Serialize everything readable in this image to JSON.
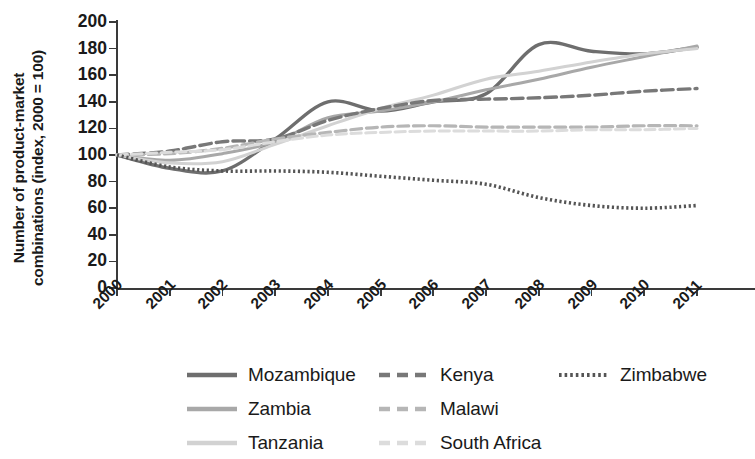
{
  "chart_data": {
    "type": "line",
    "title": "",
    "xlabel": "",
    "ylabel": "Number of product-market combinations (index, 2000 = 100)",
    "ylabel_line1": "Number of product-market",
    "ylabel_line2": "combinations (index, 2000 = 100)",
    "categories": [
      "2000",
      "2001",
      "2002",
      "2003",
      "2004",
      "2005",
      "2006",
      "2007",
      "2008",
      "2009",
      "2010",
      "2011"
    ],
    "x": [
      2000,
      2001,
      2002,
      2003,
      2004,
      2005,
      2006,
      2007,
      2008,
      2009,
      2010,
      2011
    ],
    "ylim": [
      0,
      200
    ],
    "xlim": [
      2000,
      2011
    ],
    "yticks": [
      0,
      20,
      40,
      60,
      80,
      100,
      120,
      140,
      160,
      180,
      200
    ],
    "grid": false,
    "legend_position": "bottom",
    "series": [
      {
        "name": "Mozambique",
        "style": "solid",
        "color": "#6e6e6e",
        "width": 3.4,
        "values": [
          100,
          90,
          88,
          112,
          140,
          133,
          140,
          146,
          183,
          178,
          176,
          181
        ]
      },
      {
        "name": "Zambia",
        "style": "solid",
        "color": "#a8a8a8",
        "width": 3.0,
        "values": [
          100,
          96,
          101,
          110,
          128,
          133,
          140,
          149,
          157,
          166,
          174,
          182
        ]
      },
      {
        "name": "Tanzania",
        "style": "solid",
        "color": "#d2d2d2",
        "width": 3.0,
        "values": [
          100,
          94,
          95,
          108,
          122,
          135,
          145,
          157,
          163,
          170,
          176,
          180
        ]
      },
      {
        "name": "Kenya",
        "style": "dashed",
        "color": "#787878",
        "width": 3.4,
        "values": [
          100,
          103,
          110,
          112,
          126,
          135,
          141,
          142,
          143,
          145,
          148,
          150
        ]
      },
      {
        "name": "Malawi",
        "style": "dashed",
        "color": "#b6b6b6",
        "width": 3.2,
        "values": [
          100,
          101,
          105,
          112,
          117,
          121,
          122,
          121,
          121,
          121,
          122,
          122
        ]
      },
      {
        "name": "South Africa",
        "style": "dashed",
        "color": "#dcdcdc",
        "width": 3.0,
        "values": [
          100,
          102,
          104,
          110,
          115,
          117,
          118,
          118,
          118,
          119,
          119,
          120
        ]
      },
      {
        "name": "Zimbabwe",
        "style": "dotted",
        "color": "#555555",
        "width": 3.6,
        "values": [
          100,
          91,
          88,
          88,
          87,
          84,
          81,
          78,
          68,
          62,
          60,
          62
        ]
      }
    ]
  },
  "axes": {
    "y_tick_labels": [
      "200",
      "180",
      "160",
      "140",
      "120",
      "100",
      "80",
      "60",
      "40",
      "20",
      "0"
    ],
    "x_tick_labels": [
      "2000",
      "2001",
      "2002",
      "2003",
      "2004",
      "2005",
      "2006",
      "2007",
      "2008",
      "2009",
      "2010",
      "2011"
    ]
  },
  "legend": {
    "items": [
      {
        "label": "Mozambique",
        "col": 0,
        "row": 0,
        "style": "solid",
        "color": "#6e6e6e"
      },
      {
        "label": "Zambia",
        "col": 0,
        "row": 1,
        "style": "solid",
        "color": "#a8a8a8"
      },
      {
        "label": "Tanzania",
        "col": 0,
        "row": 2,
        "style": "solid",
        "color": "#d2d2d2"
      },
      {
        "label": "Kenya",
        "col": 1,
        "row": 0,
        "style": "dashed",
        "color": "#787878"
      },
      {
        "label": "Malawi",
        "col": 1,
        "row": 1,
        "style": "dashed",
        "color": "#b6b6b6"
      },
      {
        "label": "South Africa",
        "col": 1,
        "row": 2,
        "style": "dashed",
        "color": "#dcdcdc"
      },
      {
        "label": "Zimbabwe",
        "col": 2,
        "row": 0,
        "style": "dotted",
        "color": "#555555"
      }
    ]
  }
}
